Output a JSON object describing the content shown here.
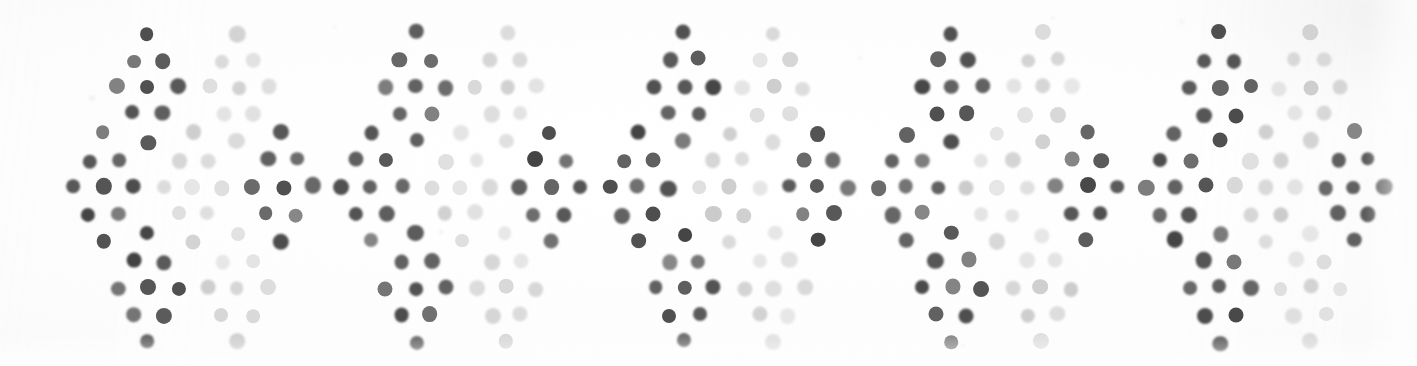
{
  "artwork": {
    "title": "Dotted diamond block-print pattern",
    "medium": "scanned printed fabric swatch",
    "background_color": "#ffffff",
    "paper_tint": "#fdfdfd",
    "canvas": {
      "width": 1417,
      "height": 366
    }
  },
  "palette": {
    "ink_dark": "#4a4a4a",
    "ink_dark_strong": "#3f3f3f",
    "ink_mid": "#6b6b6b",
    "ink_light": "#c3c3c3",
    "ink_faint": "#d6d6d6",
    "speck": "#dcdcdc"
  },
  "motif": {
    "name": "nine-dot-diamond",
    "description": "Diamond cluster of nine dots arranged 1-2-3-2-1 from top to bottom",
    "dot_count": 9,
    "dot_diameter": 15,
    "column_step": 30,
    "row_step": 27,
    "rows": [
      {
        "index": 0,
        "dots": 1,
        "offsets": [
          0
        ]
      },
      {
        "index": 1,
        "dots": 2,
        "offsets": [
          -1,
          1
        ]
      },
      {
        "index": 2,
        "dots": 3,
        "offsets": [
          -2,
          0,
          2
        ]
      },
      {
        "index": 3,
        "dots": 2,
        "offsets": [
          -1,
          1
        ]
      },
      {
        "index": 4,
        "dots": 1,
        "offsets": [
          0
        ]
      }
    ]
  },
  "layout": {
    "description": "Three horizontal bands of diamond motifs; dark motifs alternate with light motifs in a checkerboard of ink weight",
    "bands": [
      {
        "name": "top-band",
        "center_y": 87,
        "motif_count": 10
      },
      {
        "name": "middle-band",
        "center_y": 187,
        "motif_count": 11
      },
      {
        "name": "bottom-band",
        "center_y": 288,
        "motif_count": 10
      }
    ],
    "repeat_units": 5,
    "repeat_pitch": 268
  },
  "motifs": [
    {
      "cx": 148,
      "cy": 87,
      "tone": "dark",
      "band": "top"
    },
    {
      "cx": 238,
      "cy": 87,
      "tone": "light",
      "band": "top"
    },
    {
      "cx": 416,
      "cy": 87,
      "tone": "dark",
      "band": "top"
    },
    {
      "cx": 506,
      "cy": 87,
      "tone": "light",
      "band": "top"
    },
    {
      "cx": 684,
      "cy": 87,
      "tone": "dark",
      "band": "top"
    },
    {
      "cx": 774,
      "cy": 87,
      "tone": "light",
      "band": "top"
    },
    {
      "cx": 952,
      "cy": 87,
      "tone": "dark",
      "band": "top"
    },
    {
      "cx": 1042,
      "cy": 87,
      "tone": "light",
      "band": "top"
    },
    {
      "cx": 1220,
      "cy": 87,
      "tone": "dark",
      "band": "top"
    },
    {
      "cx": 1310,
      "cy": 87,
      "tone": "light",
      "band": "top"
    },
    {
      "cx": 103,
      "cy": 187,
      "tone": "dark",
      "band": "middle"
    },
    {
      "cx": 193,
      "cy": 187,
      "tone": "light",
      "band": "middle"
    },
    {
      "cx": 282,
      "cy": 187,
      "tone": "dark",
      "band": "middle"
    },
    {
      "cx": 371,
      "cy": 187,
      "tone": "dark",
      "band": "middle"
    },
    {
      "cx": 461,
      "cy": 187,
      "tone": "light",
      "band": "middle"
    },
    {
      "cx": 550,
      "cy": 187,
      "tone": "dark",
      "band": "middle"
    },
    {
      "cx": 639,
      "cy": 187,
      "tone": "dark",
      "band": "middle"
    },
    {
      "cx": 729,
      "cy": 187,
      "tone": "light",
      "band": "middle"
    },
    {
      "cx": 818,
      "cy": 187,
      "tone": "dark",
      "band": "middle"
    },
    {
      "cx": 907,
      "cy": 187,
      "tone": "dark",
      "band": "middle"
    },
    {
      "cx": 997,
      "cy": 187,
      "tone": "light",
      "band": "middle"
    },
    {
      "cx": 1086,
      "cy": 187,
      "tone": "dark",
      "band": "middle"
    },
    {
      "cx": 1175,
      "cy": 187,
      "tone": "dark",
      "band": "middle"
    },
    {
      "cx": 1265,
      "cy": 187,
      "tone": "light",
      "band": "middle"
    },
    {
      "cx": 1354,
      "cy": 187,
      "tone": "dark",
      "band": "middle"
    },
    {
      "cx": 148,
      "cy": 288,
      "tone": "dark",
      "band": "bottom"
    },
    {
      "cx": 238,
      "cy": 288,
      "tone": "light",
      "band": "bottom"
    },
    {
      "cx": 416,
      "cy": 288,
      "tone": "dark",
      "band": "bottom"
    },
    {
      "cx": 506,
      "cy": 288,
      "tone": "light",
      "band": "bottom"
    },
    {
      "cx": 684,
      "cy": 288,
      "tone": "dark",
      "band": "bottom"
    },
    {
      "cx": 774,
      "cy": 288,
      "tone": "light",
      "band": "bottom"
    },
    {
      "cx": 952,
      "cy": 288,
      "tone": "dark",
      "band": "bottom"
    },
    {
      "cx": 1042,
      "cy": 288,
      "tone": "light",
      "band": "bottom"
    },
    {
      "cx": 1220,
      "cy": 288,
      "tone": "dark",
      "band": "bottom"
    },
    {
      "cx": 1310,
      "cy": 288,
      "tone": "light",
      "band": "bottom"
    }
  ],
  "specks": [
    {
      "cx": 92,
      "cy": 98,
      "r": 3.0,
      "opacity": 0.3
    },
    {
      "cx": 335,
      "cy": 27,
      "r": 2.2,
      "opacity": 0.22
    },
    {
      "cx": 1053,
      "cy": 18,
      "r": 2.6,
      "opacity": 0.2
    },
    {
      "cx": 1182,
      "cy": 22,
      "r": 3.0,
      "opacity": 0.18
    },
    {
      "cx": 441,
      "cy": 232,
      "r": 2.0,
      "opacity": 0.35
    },
    {
      "cx": 860,
      "cy": 58,
      "r": 2.4,
      "opacity": 0.2
    },
    {
      "cx": 963,
      "cy": 345,
      "r": 2.6,
      "opacity": 0.16
    },
    {
      "cx": 1390,
      "cy": 120,
      "r": 2.2,
      "opacity": 0.15
    }
  ]
}
